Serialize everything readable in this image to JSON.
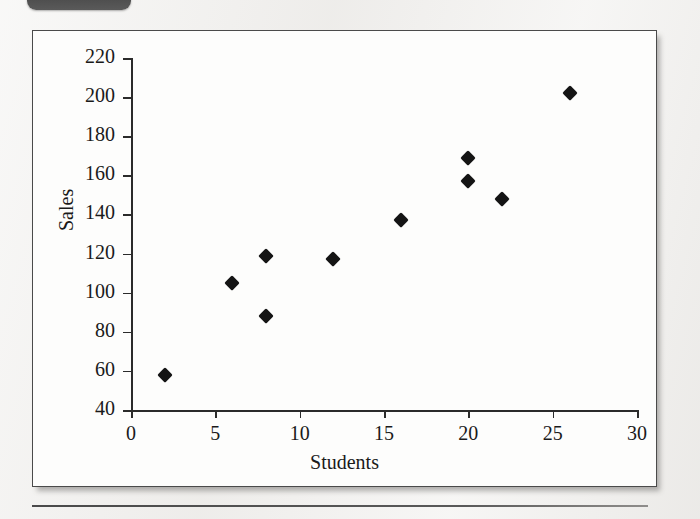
{
  "page": {
    "background_color": "#f2f1ef",
    "tab_color": "#4d4d4d",
    "figure_border_color": "#4a4a4a",
    "marker_color": "#141414"
  },
  "chart_data": {
    "type": "scatter",
    "title": "",
    "xlabel": "Students",
    "ylabel": "Sales",
    "xlim": [
      0,
      30
    ],
    "ylim": [
      40,
      220
    ],
    "xticks": [
      0,
      5,
      10,
      15,
      20,
      25,
      30
    ],
    "yticks": [
      40,
      60,
      80,
      100,
      120,
      140,
      160,
      180,
      200,
      220
    ],
    "xtick_labels": [
      "0",
      "5",
      "10",
      "15",
      "20",
      "25",
      "30"
    ],
    "ytick_labels": [
      "40",
      "60",
      "80",
      "100",
      "120",
      "140",
      "160",
      "180",
      "200",
      "220"
    ],
    "grid": false,
    "legend": false,
    "series": [
      {
        "name": "Sales vs Students",
        "marker": "diamond",
        "color": "#141414",
        "points": [
          {
            "x": 2,
            "y": 58
          },
          {
            "x": 6,
            "y": 105
          },
          {
            "x": 8,
            "y": 119
          },
          {
            "x": 8,
            "y": 88
          },
          {
            "x": 12,
            "y": 117
          },
          {
            "x": 16,
            "y": 137
          },
          {
            "x": 20,
            "y": 169
          },
          {
            "x": 20,
            "y": 157
          },
          {
            "x": 22,
            "y": 148
          },
          {
            "x": 26,
            "y": 202
          }
        ]
      }
    ]
  }
}
